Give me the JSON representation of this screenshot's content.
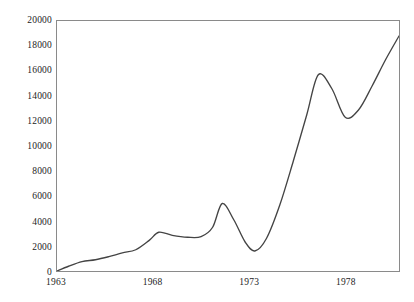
{
  "chart_data": {
    "type": "line",
    "title": "",
    "subtitle": "",
    "xlabel": "",
    "ylabel": "",
    "xlim": [
      1963,
      1980.8
    ],
    "ylim": [
      0,
      20000
    ],
    "grid": false,
    "legend": null,
    "y_ticks": [
      20000,
      18000,
      16000,
      14000,
      12000,
      10000,
      8000,
      6000,
      4000,
      2000,
      0
    ],
    "y_tick_labels": [
      "20000",
      "18000",
      "16000",
      "14000",
      "12000",
      "10000",
      "8000",
      "6000",
      "4000",
      "2000",
      "0"
    ],
    "x_ticks": [
      1963,
      1968,
      1973,
      1978
    ],
    "x_tick_labels": [
      "1963",
      "1968",
      "1973",
      "1978"
    ],
    "series": [
      {
        "name": "",
        "color": "#444444",
        "x": [
          1963.0,
          1963.6,
          1964.3,
          1965.0,
          1965.7,
          1966.4,
          1967.1,
          1967.8,
          1968.3,
          1969.0,
          1969.8,
          1970.5,
          1971.1,
          1971.6,
          1972.2,
          1972.8,
          1973.3,
          1973.9,
          1974.6,
          1975.3,
          1976.0,
          1976.6,
          1977.3,
          1978.0,
          1978.7,
          1979.4,
          1980.1,
          1980.8
        ],
        "y": [
          0,
          380,
          750,
          900,
          1150,
          1450,
          1700,
          2450,
          3100,
          2850,
          2700,
          2750,
          3500,
          5400,
          4100,
          2300,
          1600,
          2600,
          5300,
          8800,
          12500,
          15700,
          14600,
          12300,
          12900,
          14800,
          16900,
          18800
        ]
      }
    ]
  },
  "axis": {
    "y_labels": [
      "20000",
      "18000",
      "16000",
      "14000",
      "12000",
      "10000",
      "8000",
      "6000",
      "4000",
      "2000",
      "0"
    ],
    "x_labels": [
      "1963",
      "1968",
      "1973",
      "1978"
    ]
  },
  "caption": {
    "clipped_text": ""
  },
  "style": {
    "line_color": "#444444",
    "frame_color": "#8a8a8a",
    "background": "#ffffff",
    "text_color": "#1c1c1c"
  }
}
